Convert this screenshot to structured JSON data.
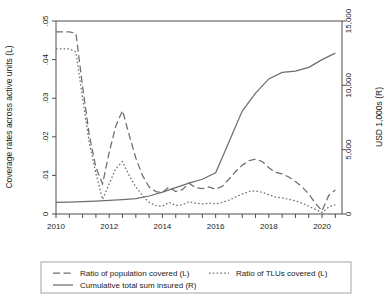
{
  "chart_data": {
    "type": "line",
    "title": "",
    "xlabel": "",
    "ylabel": "Coverage rates across active units (L)",
    "y2label": "USD 1,000s (R)",
    "xlim": [
      2010,
      2020.75
    ],
    "ylim": [
      0,
      0.05
    ],
    "y2lim": [
      0,
      15000
    ],
    "grid": false,
    "legend_position": "below-plot",
    "x_ticks": [
      2010,
      2012,
      2014,
      2016,
      2018,
      2020
    ],
    "x_tick_labels": [
      "2010",
      "2012",
      "2014",
      "2016",
      "2018",
      "2020"
    ],
    "x_minor_tick_interval": 0.5,
    "y_ticks": [
      0,
      0.01,
      0.02,
      0.03,
      0.04,
      0.05
    ],
    "y_tick_labels": [
      "0",
      ".01",
      ".02",
      ".03",
      ".04",
      ".05"
    ],
    "y2_ticks": [
      0,
      5000,
      10000,
      15000
    ],
    "y2_tick_labels": [
      "0",
      "5,000",
      "10,000",
      "15,000"
    ],
    "series": [
      {
        "name": "Ratio of population covered (L)",
        "style": "dashed",
        "axis": "left",
        "color": "#6e6e6e",
        "x": [
          2010.0,
          2010.5,
          2010.75,
          2011.0,
          2011.25,
          2011.5,
          2011.75,
          2012.0,
          2012.25,
          2012.5,
          2012.75,
          2013.0,
          2013.25,
          2013.5,
          2013.75,
          2014.0,
          2014.25,
          2014.5,
          2014.75,
          2015.0,
          2015.25,
          2015.5,
          2015.75,
          2016.0,
          2016.25,
          2016.5,
          2016.75,
          2017.0,
          2017.25,
          2017.5,
          2017.75,
          2018.0,
          2018.25,
          2018.5,
          2018.75,
          2019.0,
          2019.25,
          2019.5,
          2019.75,
          2020.0,
          2020.25,
          2020.5
        ],
        "y": [
          0.0472,
          0.0472,
          0.0468,
          0.033,
          0.0205,
          0.012,
          0.0078,
          0.016,
          0.0228,
          0.0268,
          0.0205,
          0.0145,
          0.01,
          0.007,
          0.0058,
          0.0056,
          0.007,
          0.0058,
          0.0063,
          0.008,
          0.0068,
          0.0066,
          0.007,
          0.0064,
          0.0072,
          0.009,
          0.011,
          0.0126,
          0.0138,
          0.0142,
          0.0136,
          0.012,
          0.0108,
          0.0104,
          0.0096,
          0.0084,
          0.007,
          0.0052,
          0.0028,
          0.0008,
          0.0048,
          0.0062
        ]
      },
      {
        "name": "Ratio of TLUs covered (L)",
        "style": "dotted",
        "axis": "left",
        "color": "#6e6e6e",
        "x": [
          2010.0,
          2010.5,
          2010.75,
          2011.0,
          2011.25,
          2011.5,
          2011.75,
          2012.0,
          2012.25,
          2012.5,
          2012.75,
          2013.0,
          2013.25,
          2013.5,
          2013.75,
          2014.0,
          2014.25,
          2014.5,
          2014.75,
          2015.0,
          2015.25,
          2015.5,
          2015.75,
          2016.0,
          2016.25,
          2016.5,
          2016.75,
          2017.0,
          2017.25,
          2017.5,
          2017.75,
          2018.0,
          2018.25,
          2018.5,
          2018.75,
          2019.0,
          2019.25,
          2019.5,
          2019.75,
          2020.0,
          2020.25,
          2020.5
        ],
        "y": [
          0.0428,
          0.0428,
          0.042,
          0.03,
          0.0185,
          0.0105,
          0.0038,
          0.0078,
          0.0118,
          0.0136,
          0.01,
          0.007,
          0.0048,
          0.003,
          0.0022,
          0.002,
          0.003,
          0.0022,
          0.0024,
          0.0032,
          0.0028,
          0.0026,
          0.0028,
          0.0026,
          0.003,
          0.0036,
          0.0044,
          0.0052,
          0.0058,
          0.006,
          0.0056,
          0.005,
          0.0044,
          0.0042,
          0.0038,
          0.0034,
          0.0028,
          0.002,
          0.0012,
          0.0004,
          0.0018,
          0.0024
        ]
      },
      {
        "name": "Cumulative total sum insured (R)",
        "style": "solid",
        "axis": "right",
        "color": "#6e6e6e",
        "x": [
          2010.0,
          2010.5,
          2011.0,
          2011.5,
          2012.0,
          2012.5,
          2013.0,
          2013.5,
          2014.0,
          2014.5,
          2015.0,
          2015.5,
          2016.0,
          2016.25,
          2016.5,
          2016.75,
          2017.0,
          2017.5,
          2018.0,
          2018.5,
          2019.0,
          2019.5,
          2020.0,
          2020.5
        ],
        "y": [
          900,
          920,
          960,
          1000,
          1060,
          1120,
          1200,
          1400,
          1700,
          2050,
          2400,
          2700,
          3200,
          4400,
          5600,
          6800,
          8000,
          9400,
          10500,
          11000,
          11100,
          11400,
          12000,
          12500
        ]
      }
    ]
  },
  "axes": {
    "left_title": "Coverage rates across active units (L)",
    "right_title": "USD 1,000s (R)"
  },
  "legend": {
    "items": [
      {
        "label": "Ratio of population covered (L)",
        "style": "dashed"
      },
      {
        "label": "Ratio of TLUs covered (L)",
        "style": "dotted"
      },
      {
        "label": "Cumulative total sum insured (R)",
        "style": "solid"
      }
    ]
  }
}
